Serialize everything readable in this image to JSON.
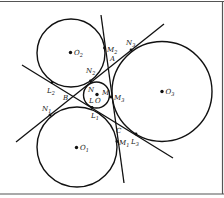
{
  "diagram": {
    "title": "",
    "circles": [
      {
        "id": "O1",
        "label": "O",
        "sub": "1"
      },
      {
        "id": "O2",
        "label": "O",
        "sub": "2"
      },
      {
        "id": "O3",
        "label": "O",
        "sub": "3"
      },
      {
        "id": "O",
        "label": "O",
        "sub": ""
      }
    ],
    "lines": [
      {
        "id": "line-L",
        "points": [
          "L2",
          "B",
          "L1",
          "C",
          "L3"
        ]
      },
      {
        "id": "line-N",
        "points": [
          "N1",
          "B",
          "N2",
          "A",
          "N3"
        ]
      },
      {
        "id": "line-M",
        "points": [
          "M2",
          "A",
          "M3",
          "C",
          "M1"
        ]
      }
    ],
    "labels": {
      "A": "A",
      "B": "B",
      "C": "C",
      "L": "L",
      "M": "M",
      "N": "N",
      "L1": {
        "t": "L",
        "s": "1"
      },
      "L2": {
        "t": "L",
        "s": "2"
      },
      "L3": {
        "t": "L",
        "s": "3"
      },
      "M1": {
        "t": "M",
        "s": "1"
      },
      "M2": {
        "t": "M",
        "s": "2"
      },
      "M3": {
        "t": "M",
        "s": "3"
      },
      "N1": {
        "t": "N",
        "s": "1"
      },
      "N2": {
        "t": "N",
        "s": "2"
      },
      "N3": {
        "t": "N",
        "s": "3"
      }
    }
  }
}
